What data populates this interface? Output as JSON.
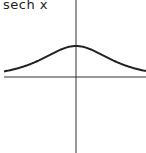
{
  "chart_data": {
    "type": "line",
    "title": "sech x",
    "xlabel": "",
    "ylabel": "",
    "xlim": [
      -2.3,
      2.2
    ],
    "ylim": [
      -2.5,
      2.5
    ],
    "grid": false,
    "series": [
      {
        "name": "sech x",
        "function": "sech(x)",
        "x": [
          -2.3,
          -2,
          -1.5,
          -1,
          -0.5,
          0,
          0.5,
          1,
          1.5,
          2,
          2.2
        ],
        "values": [
          0.198,
          0.266,
          0.425,
          0.648,
          0.887,
          1.0,
          0.887,
          0.648,
          0.425,
          0.266,
          0.219
        ]
      }
    ]
  },
  "colors": {
    "curve": "#222222",
    "axes": "#333333"
  }
}
